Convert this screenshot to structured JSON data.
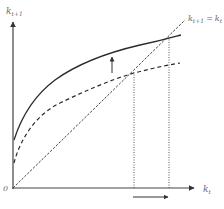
{
  "diagram": {
    "type": "phase-diagram",
    "y_axis": {
      "label": "k",
      "subscript": "t+1"
    },
    "x_axis": {
      "label": "k",
      "subscript": "t"
    },
    "origin_label": "0",
    "line_45_label": {
      "lhs": "k",
      "lhs_sub": "t+1",
      "eq": "=",
      "rhs": "k",
      "rhs_sub": "t"
    },
    "curves": [
      {
        "name": "solid-curve",
        "style": "solid",
        "meaning": "shifted-up transition curve"
      },
      {
        "name": "dashed-curve",
        "style": "dashed",
        "meaning": "original transition curve"
      },
      {
        "name": "45-degree-line",
        "style": "dashed"
      }
    ],
    "steady_states": [
      {
        "name": "initial",
        "x_px": 134
      },
      {
        "name": "new",
        "x_px": 169
      }
    ],
    "arrows": [
      {
        "name": "upward-shift-arrow",
        "direction": "up"
      },
      {
        "name": "steady-state-increase-arrow",
        "direction": "right"
      }
    ],
    "colors": {
      "axis": "#333333",
      "curve": "#2a2a2a",
      "label": "#6a6a6a",
      "dotted": "#555555"
    }
  }
}
